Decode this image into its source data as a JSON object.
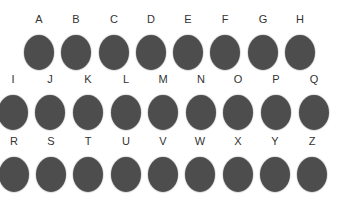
{
  "dot_color": "#4d4d4d",
  "label_color": "#333333",
  "rows": [
    {
      "y": 12,
      "items": [
        {
          "label": "A",
          "cx": 39
        },
        {
          "label": "B",
          "cx": 76
        },
        {
          "label": "C",
          "cx": 114
        },
        {
          "label": "D",
          "cx": 151
        },
        {
          "label": "E",
          "cx": 188
        },
        {
          "label": "F",
          "cx": 225
        },
        {
          "label": "G",
          "cx": 263
        },
        {
          "label": "H",
          "cx": 300
        }
      ]
    },
    {
      "y": 72,
      "items": [
        {
          "label": "I",
          "cx": 13
        },
        {
          "label": "J",
          "cx": 50
        },
        {
          "label": "K",
          "cx": 88
        },
        {
          "label": "L",
          "cx": 126
        },
        {
          "label": "M",
          "cx": 163
        },
        {
          "label": "N",
          "cx": 201
        },
        {
          "label": "O",
          "cx": 238
        },
        {
          "label": "P",
          "cx": 276
        },
        {
          "label": "Q",
          "cx": 314
        }
      ]
    },
    {
      "y": 134,
      "items": [
        {
          "label": "R",
          "cx": 14
        },
        {
          "label": "S",
          "cx": 51
        },
        {
          "label": "T",
          "cx": 88
        },
        {
          "label": "U",
          "cx": 126
        },
        {
          "label": "V",
          "cx": 163
        },
        {
          "label": "W",
          "cx": 200
        },
        {
          "label": "X",
          "cx": 238
        },
        {
          "label": "Y",
          "cx": 275
        },
        {
          "label": "Z",
          "cx": 312
        }
      ]
    }
  ]
}
